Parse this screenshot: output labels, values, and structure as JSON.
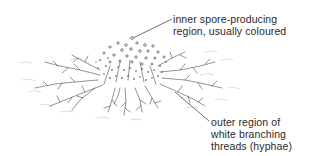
{
  "diagram": {
    "labels": [
      {
        "id": "inner",
        "lines": [
          "inner spore-producing",
          "region, usually coloured"
        ]
      },
      {
        "id": "outer",
        "lines": [
          "outer region of",
          "white branching",
          "threads (hyphae)"
        ]
      }
    ],
    "colors": {
      "ink": "#2a2a2a",
      "faint": "#b8b8b8",
      "background": "#ffffff"
    }
  }
}
